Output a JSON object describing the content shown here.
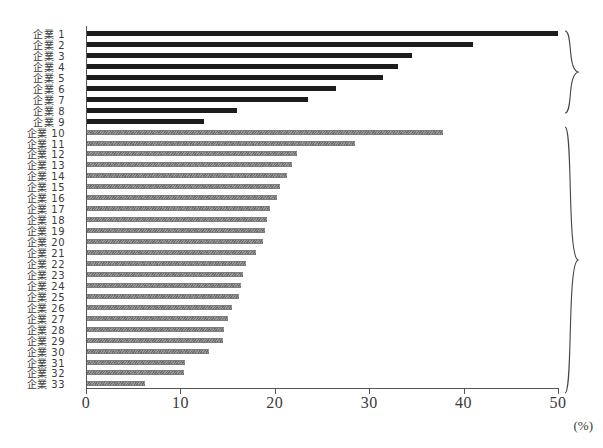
{
  "chart_data": {
    "type": "bar",
    "orientation": "horizontal",
    "title": "",
    "xlabel": "(%)",
    "ylabel": "",
    "xlim": [
      0,
      50
    ],
    "xticks": [
      0,
      10,
      20,
      30,
      40,
      50
    ],
    "xtick_labels": [
      "0",
      "10",
      "20",
      "30",
      "40",
      "50"
    ],
    "grid": false,
    "legend": "none",
    "unit": "(%)",
    "categories": [
      "企業 1",
      "企業 2",
      "企業 3",
      "企業 4",
      "企業 5",
      "企業 6",
      "企業 7",
      "企業 8",
      "企業 9",
      "企業 10",
      "企業 11",
      "企業 12",
      "企業 13",
      "企業 14",
      "企業 15",
      "企業 16",
      "企業 17",
      "企業 18",
      "企業 19",
      "企業 20",
      "企業 21",
      "企業 22",
      "企業 23",
      "企業 24",
      "企業 25",
      "企業 26",
      "企業 27",
      "企業 28",
      "企業 29",
      "企業 30",
      "企業 31",
      "企業 32",
      "企業 33"
    ],
    "values": [
      50.0,
      41.0,
      34.5,
      33.0,
      31.5,
      26.5,
      23.5,
      16.0,
      12.5,
      37.8,
      28.5,
      22.3,
      21.8,
      21.3,
      20.5,
      20.2,
      19.5,
      19.2,
      19.0,
      18.8,
      18.0,
      17.0,
      16.6,
      16.4,
      16.2,
      15.5,
      15.0,
      14.6,
      14.5,
      13.0,
      10.5,
      10.4,
      6.2
    ],
    "groups": [
      {
        "name": "group-upper",
        "first_index": 0,
        "last_index": 8,
        "series": "dark",
        "color": "#1c1c1c"
      },
      {
        "name": "group-lower",
        "first_index": 9,
        "last_index": 32,
        "series": "light",
        "color": "#8a8a8a"
      }
    ],
    "series": [
      {
        "name": "dark-group",
        "color": "#1c1c1c"
      },
      {
        "name": "hatched-group",
        "color": "#8a8a8a"
      }
    ]
  }
}
